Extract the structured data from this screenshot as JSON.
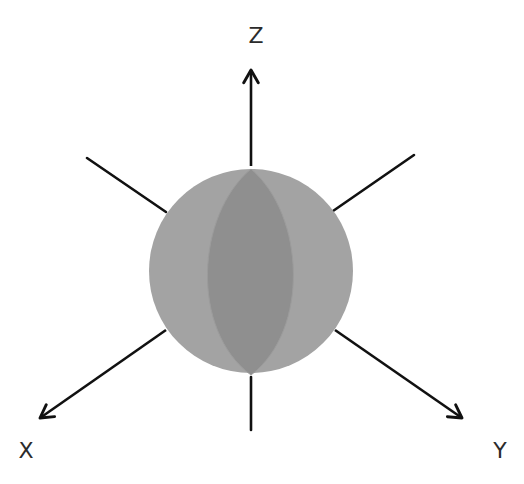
{
  "diagram": {
    "type": "3d-axes-sphere",
    "axes": {
      "x": {
        "label": "X"
      },
      "y": {
        "label": "Y"
      },
      "z": {
        "label": "Z"
      }
    },
    "sphere": {
      "fill": "#a3a3a3",
      "lens_fill": "#8e8e8e",
      "stroke": "#9a9a9a"
    },
    "line_color": "#111111"
  }
}
